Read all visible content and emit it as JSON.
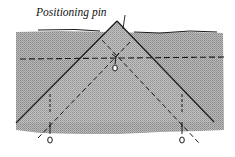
{
  "diagram": {
    "label": "Positioning pin",
    "colors": {
      "fabric": "#a9a9a9",
      "fabric_fold": "#b4b4b4",
      "line": "#1a1a1a",
      "background": "#ffffff"
    },
    "elements": {
      "fabric_band": "gray stippled fabric strip",
      "folded_triangle": "folded corner point",
      "horizontal_fold_line": "dashed horizontal line",
      "inner_v_lines": "dashed diagonal fold lines",
      "pins": [
        "center positioning pin",
        "left pin",
        "right pin"
      ]
    }
  }
}
